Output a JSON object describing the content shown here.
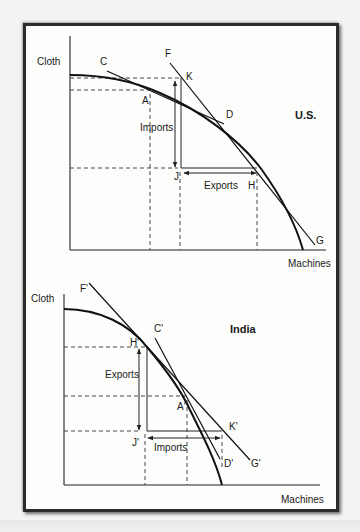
{
  "figure": {
    "panels": [
      {
        "id": "us",
        "title": "U.S.",
        "y_axis_label": "Cloth",
        "x_axis_label": "Machines",
        "curve": "production possibility frontier",
        "points": {
          "C": "C",
          "D": "D",
          "F": "F",
          "G": "G",
          "A": "A",
          "K": "K",
          "J": "J",
          "H": "H"
        },
        "labels": {
          "imports": "Imports",
          "exports": "Exports"
        }
      },
      {
        "id": "india",
        "title": "India",
        "y_axis_label": "Cloth",
        "x_axis_label": "Machines",
        "curve": "production possibility frontier",
        "points": {
          "F": "F'",
          "C": "C'",
          "H": "H'",
          "A": "A'",
          "K": "K'",
          "J": "J'",
          "D": "D'",
          "G": "G'"
        },
        "labels": {
          "exports": "Exports",
          "imports": "Imports"
        }
      }
    ]
  }
}
